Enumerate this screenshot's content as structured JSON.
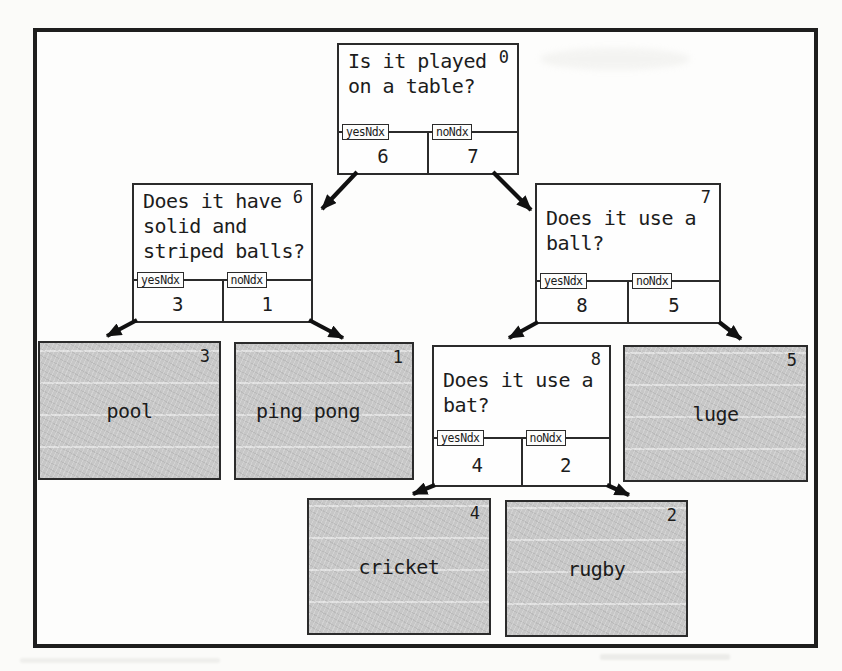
{
  "colors": {
    "paper": "#fbfbf9",
    "frame_border": "#1e1e1e",
    "node_border": "#2b2b2b",
    "node_fill": "#fefefe",
    "leaf_fill": "#c7c7c7",
    "text": "#1c1c1c",
    "arrow": "#111111"
  },
  "tree": {
    "nodes": [
      {
        "index": "0",
        "question": "Is it played\non a table?",
        "yes_label": "yesNdx",
        "no_label": "noNdx",
        "yes_child": "6",
        "no_child": "7"
      },
      {
        "index": "6",
        "question": "Does it have\nsolid and\nstriped balls?",
        "yes_label": "yesNdx",
        "no_label": "noNdx",
        "yes_child": "3",
        "no_child": "1"
      },
      {
        "index": "7",
        "question": "Does it use a\nball?",
        "yes_label": "yesNdx",
        "no_label": "noNdx",
        "yes_child": "8",
        "no_child": "5"
      },
      {
        "index": "8",
        "question": "Does it use a\nbat?",
        "yes_label": "yesNdx",
        "no_label": "noNdx",
        "yes_child": "4",
        "no_child": "2"
      }
    ],
    "leaves": [
      {
        "index": "3",
        "label": "pool"
      },
      {
        "index": "1",
        "label": "ping pong"
      },
      {
        "index": "5",
        "label": "luge"
      },
      {
        "index": "4",
        "label": "cricket"
      },
      {
        "index": "2",
        "label": "rugby"
      }
    ],
    "edges": [
      {
        "from": "0",
        "branch": "yes",
        "to": "6"
      },
      {
        "from": "0",
        "branch": "no",
        "to": "7"
      },
      {
        "from": "6",
        "branch": "yes",
        "to": "3"
      },
      {
        "from": "6",
        "branch": "no",
        "to": "1"
      },
      {
        "from": "7",
        "branch": "yes",
        "to": "8"
      },
      {
        "from": "7",
        "branch": "no",
        "to": "5"
      },
      {
        "from": "8",
        "branch": "yes",
        "to": "4"
      },
      {
        "from": "8",
        "branch": "no",
        "to": "2"
      }
    ]
  }
}
